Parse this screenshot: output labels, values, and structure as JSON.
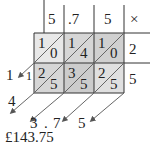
{
  "header": {
    "digits": [
      "5",
      ".7",
      "5"
    ],
    "operator": "×"
  },
  "rows": [
    {
      "multiplier": "2",
      "cells": [
        {
          "tens": "1",
          "units": "0"
        },
        {
          "tens": "1",
          "units": "4"
        },
        {
          "tens": "1",
          "units": "0"
        }
      ]
    },
    {
      "multiplier": "5",
      "cells": [
        {
          "tens": "2",
          "units": "5"
        },
        {
          "tens": "3",
          "units": "5"
        },
        {
          "tens": "2",
          "units": "5"
        }
      ]
    }
  ],
  "left_results": {
    "top": "1",
    "carry": "1",
    "bottom": "4"
  },
  "bottom_results": [
    "3",
    ".",
    "7",
    "5"
  ],
  "answer": "£143.75",
  "colors": {
    "cell_light": "#e6e6e6",
    "cell_dark": "#cfcfcf",
    "line": "#333333",
    "arrow": "#555555"
  }
}
